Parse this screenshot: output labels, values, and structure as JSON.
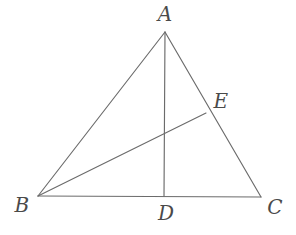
{
  "figure": {
    "canvas": {
      "width": 296,
      "height": 235,
      "background": "#ffffff"
    },
    "stroke": {
      "color": "#6b6b6b",
      "width": 1.15
    },
    "label_color": "#4a4a4a",
    "points": [
      {
        "id": "A",
        "label": "A",
        "x": 165,
        "y": 32,
        "label_x": 165,
        "label_y": 14
      },
      {
        "id": "B",
        "label": "B",
        "x": 38,
        "y": 196,
        "label_x": 22,
        "label_y": 205
      },
      {
        "id": "C",
        "label": "C",
        "x": 261,
        "y": 197,
        "label_x": 275,
        "label_y": 207
      },
      {
        "id": "D",
        "label": "D",
        "x": 164,
        "y": 196,
        "label_x": 166,
        "label_y": 213
      },
      {
        "id": "E",
        "label": "E",
        "x": 206,
        "y": 113,
        "label_x": 221,
        "label_y": 101
      }
    ],
    "segments": [
      {
        "id": "AB",
        "from": "A",
        "to": "B",
        "name": "segment-ab"
      },
      {
        "id": "AC",
        "from": "A",
        "to": "C",
        "name": "segment-ac"
      },
      {
        "id": "BC",
        "from": "B",
        "to": "C",
        "name": "segment-bc"
      },
      {
        "id": "AD",
        "from": "A",
        "to": "D",
        "name": "segment-ad"
      },
      {
        "id": "BE",
        "from": "B",
        "to": "E",
        "name": "segment-be"
      }
    ]
  }
}
